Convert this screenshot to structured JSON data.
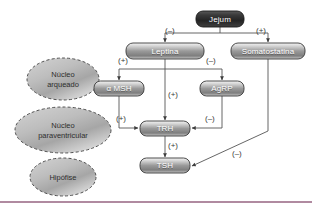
{
  "figure": {
    "background_color": "#ffffff",
    "rule_color": "#b08aa0"
  },
  "nodes": [
    {
      "id": "jejum",
      "label": "Jejum",
      "style": "dark",
      "x": 196,
      "y": 11,
      "w": 48,
      "h": 16
    },
    {
      "id": "leptina",
      "label": "Leptina",
      "style": "light",
      "x": 126,
      "y": 43,
      "w": 78,
      "h": 16
    },
    {
      "id": "somatostatina",
      "label": "Somatostatina",
      "style": "light",
      "x": 231,
      "y": 43,
      "w": 74,
      "h": 16
    },
    {
      "id": "amsh",
      "label": "α MSH",
      "style": "light",
      "x": 94,
      "y": 81,
      "w": 50,
      "h": 15
    },
    {
      "id": "agrp",
      "label": "AgRP",
      "style": "light",
      "x": 200,
      "y": 81,
      "w": 44,
      "h": 15
    },
    {
      "id": "trh",
      "label": "TRH",
      "style": "light",
      "x": 140,
      "y": 121,
      "w": 50,
      "h": 15
    },
    {
      "id": "tsh",
      "label": "TSH",
      "style": "light",
      "x": 140,
      "y": 158,
      "w": 50,
      "h": 15
    }
  ],
  "regions": [
    {
      "id": "nucleo-arqueado",
      "lines": [
        "Núcleo",
        "arqueado"
      ],
      "cx": 63,
      "cy": 79,
      "rx": 36,
      "ry": 21
    },
    {
      "id": "nucleo-paraventricular",
      "lines": [
        "Núcleo",
        "paraventricular"
      ],
      "cx": 63,
      "cy": 130,
      "rx": 48,
      "ry": 23
    },
    {
      "id": "hipofise",
      "lines": [
        "Hipófise"
      ],
      "cx": 63,
      "cy": 177,
      "rx": 33,
      "ry": 19
    }
  ],
  "edges": [
    {
      "id": "jejum-to-leptina",
      "from": "jejum",
      "to": "leptina",
      "sign": "(–)",
      "sign_x": 165,
      "sign_y": 27
    },
    {
      "id": "jejum-to-somatostatina",
      "from": "jejum",
      "to": "somatostatina",
      "sign": "(+)",
      "sign_x": 256,
      "sign_y": 27
    },
    {
      "id": "leptina-to-amsh",
      "from": "leptina",
      "to": "amsh",
      "sign": "(+)",
      "sign_x": 118,
      "sign_y": 64
    },
    {
      "id": "leptina-to-agrp",
      "from": "leptina",
      "to": "agrp",
      "sign": "(–)",
      "sign_x": 206,
      "sign_y": 64
    },
    {
      "id": "leptina-to-trh",
      "from": "leptina",
      "to": "trh",
      "sign": "(+)",
      "sign_x": 168,
      "sign_y": 91
    },
    {
      "id": "amsh-to-trh",
      "from": "amsh",
      "to": "trh",
      "sign": "(+)",
      "sign_x": 118,
      "sign_y": 117
    },
    {
      "id": "agrp-to-trh",
      "from": "agrp",
      "to": "trh",
      "sign": "(–)",
      "sign_x": 206,
      "sign_y": 117
    },
    {
      "id": "trh-to-tsh",
      "from": "trh",
      "to": "tsh",
      "sign": "(+)",
      "sign_x": 168,
      "sign_y": 144
    },
    {
      "id": "somatostatina-to-tsh",
      "from": "somatostatina",
      "to": "tsh",
      "sign": "(–)",
      "sign_x": 232,
      "sign_y": 150
    }
  ],
  "signs": {
    "positive": "(+)",
    "negative": "(–)"
  }
}
